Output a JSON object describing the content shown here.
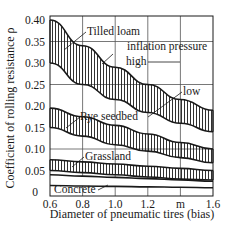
{
  "chart_data": {
    "type": "area",
    "title": "",
    "xlabel": "Diameter of pneumatic tires (bias)",
    "ylabel": "Coefficient of rolling resistance ρ",
    "x_unit_label": "m",
    "xlim": [
      0.6,
      1.6
    ],
    "ylim": [
      0,
      0.4
    ],
    "grid": true,
    "x_ticks": [
      "0.6",
      "0.8",
      "1.0",
      "1.2",
      "m",
      "1.6"
    ],
    "x_tick_values": [
      0.6,
      0.8,
      1.0,
      1.2,
      1.4,
      1.6
    ],
    "y_ticks": [
      "0",
      "0.05",
      "0.10",
      "0.15",
      "0.20",
      "0.25",
      "0.30",
      "0.35",
      "0.40"
    ],
    "y_tick_values": [
      0,
      0.05,
      0.1,
      0.15,
      0.2,
      0.25,
      0.3,
      0.35,
      0.4
    ],
    "x": [
      0.6,
      0.8,
      1.0,
      1.2,
      1.4,
      1.6
    ],
    "series": [
      {
        "name": "Tilled loam",
        "upper": [
          0.4,
          0.34,
          0.29,
          0.25,
          0.215,
          0.19
        ],
        "lower": [
          0.3,
          0.25,
          0.215,
          0.185,
          0.16,
          0.14
        ],
        "hatched": true
      },
      {
        "name": "Rye seedbed",
        "upper": [
          0.195,
          0.175,
          0.155,
          0.135,
          0.115,
          0.1
        ],
        "lower": [
          0.15,
          0.13,
          0.11,
          0.095,
          0.08,
          0.068
        ],
        "hatched": true
      },
      {
        "name": "Grassland",
        "upper": [
          0.075,
          0.07,
          0.065,
          0.06,
          0.055,
          0.05
        ],
        "lower": [
          0.05,
          0.045,
          0.04,
          0.035,
          0.03,
          0.028
        ],
        "hatched": true
      },
      {
        "name": "Concrete",
        "upper": [
          0.04,
          0.037,
          0.034,
          0.031,
          0.028,
          0.025
        ],
        "lower": [
          0.015,
          0.014,
          0.013,
          0.012,
          0.011,
          0.01
        ],
        "hatched": false
      }
    ],
    "annotations": [
      {
        "text": "Tilled loam",
        "points_to": "Tilled loam band"
      },
      {
        "text": "inflation pressure",
        "points_to": "Tilled loam upper curve"
      },
      {
        "text": "high",
        "points_to": "Tilled loam upper curve (high inflation pressure)"
      },
      {
        "text": "low",
        "points_to": "Tilled loam lower curve (low inflation pressure)"
      },
      {
        "text": "Rye seedbed",
        "points_to": "Rye seedbed band"
      },
      {
        "text": "Grassland",
        "points_to": "Grassland band"
      },
      {
        "text": "Concrete",
        "points_to": "Concrete band"
      }
    ],
    "legend": "none (inline labels)"
  },
  "labels": {
    "tilled_loam": "Tilled loam",
    "inflation_pressure": "inflation pressure",
    "high": "high",
    "low": "low",
    "rye_seedbed": "Rye seedbed",
    "grassland": "Grassland",
    "concrete": "Concrete"
  },
  "axes": {
    "xlabel": "Diameter of pneumatic tires (bias)",
    "ylabel": "Coefficient of rolling resistance ρ",
    "x_ticks": [
      "0.6",
      "0.8",
      "1.0",
      "1.2",
      "m",
      "1.6"
    ],
    "y_ticks": [
      "0.40",
      "0.35",
      "0.30",
      "0.25",
      "0.20",
      "0.15",
      "0.10",
      "0.05",
      "0"
    ]
  },
  "colors": {
    "ink": "#1a1a1a",
    "grid": "#555555",
    "background": "#ffffff"
  }
}
